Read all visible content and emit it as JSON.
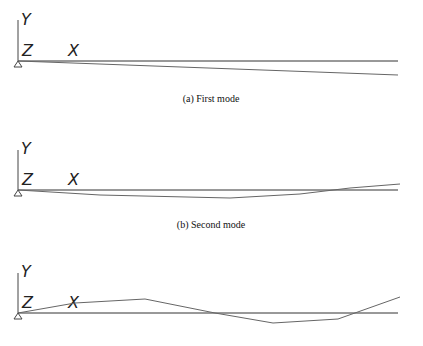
{
  "panels": [
    {
      "caption": "(a) First mode",
      "axes": {
        "y": "Y",
        "z": "Z",
        "x": "X"
      },
      "origin": [
        18,
        61
      ],
      "baseline_end_x": 398,
      "mode_shape": [
        [
          18,
          61
        ],
        [
          398,
          75
        ]
      ]
    },
    {
      "caption": "(b) Second mode",
      "axes": {
        "y": "Y",
        "z": "Z",
        "x": "X"
      },
      "origin": [
        18,
        190
      ],
      "baseline_end_x": 398,
      "mode_shape": [
        [
          18,
          190
        ],
        [
          100,
          195
        ],
        [
          230,
          198
        ],
        [
          300,
          194
        ],
        [
          350,
          188
        ],
        [
          400,
          184
        ]
      ]
    },
    {
      "caption": "",
      "axes": {
        "y": "Y",
        "z": "Z",
        "x": "X"
      },
      "origin": [
        18,
        313
      ],
      "baseline_end_x": 398,
      "mode_shape": [
        [
          18,
          313
        ],
        [
          75,
          303
        ],
        [
          145,
          299
        ],
        [
          215,
          313
        ],
        [
          273,
          323
        ],
        [
          338,
          319
        ],
        [
          400,
          297
        ]
      ]
    }
  ],
  "colors": {
    "baseline": "#333333",
    "mode_line": "#666666",
    "axis": "#444444"
  }
}
